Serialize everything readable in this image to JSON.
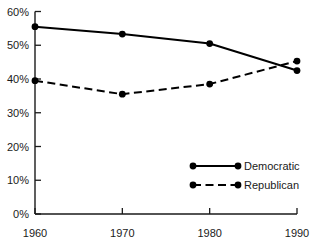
{
  "chart_data": {
    "type": "line",
    "title": "",
    "subtitle": "",
    "xlabel": "",
    "ylabel": "",
    "x": [
      1960,
      1970,
      1980,
      1990
    ],
    "categories": [
      "1960",
      "1970",
      "1980",
      "1990"
    ],
    "xlim": [
      1960,
      1990
    ],
    "ylim": [
      0,
      60
    ],
    "y_tick_values": [
      0,
      10,
      20,
      30,
      40,
      50,
      60
    ],
    "y_tick_labels": [
      "0%",
      "10%",
      "20%",
      "30%",
      "40%",
      "50%",
      "60%"
    ],
    "x_tick_labels": [
      "1960",
      "1970",
      "1980",
      "1990"
    ],
    "grid": false,
    "legend_position": "inside-lower-right",
    "series": [
      {
        "name": "Democratic",
        "values": [
          55.5,
          53.3,
          50.5,
          42.5
        ],
        "style": "solid",
        "marker": "circle",
        "color": "#000000"
      },
      {
        "name": "Republican",
        "values": [
          39.5,
          35.5,
          38.5,
          45.3
        ],
        "style": "dashed",
        "marker": "circle",
        "color": "#000000"
      }
    ],
    "annotations": []
  },
  "axis": {
    "y_labels": [
      "60%",
      "50%",
      "40%",
      "30%",
      "20%",
      "10%",
      "0%"
    ],
    "x_labels": [
      "1960",
      "1970",
      "1980",
      "1990"
    ]
  },
  "legend": {
    "items": [
      {
        "label": "Democratic",
        "style": "solid"
      },
      {
        "label": "Republican",
        "style": "dashed"
      }
    ]
  },
  "colors": {
    "line": "#000000",
    "axis": "#1a1a1a",
    "text": "#1a1a1a",
    "background": "#ffffff"
  }
}
